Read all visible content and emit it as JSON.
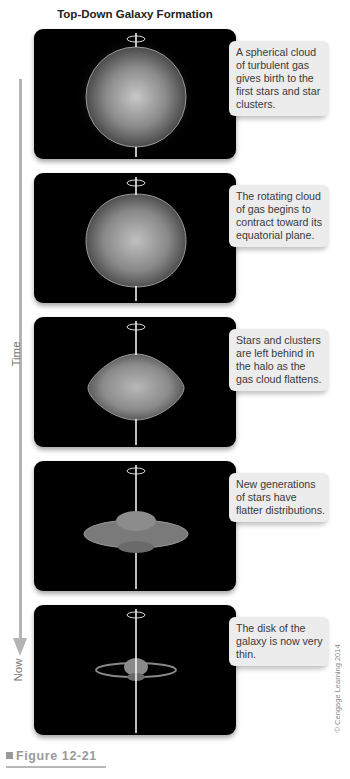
{
  "title": "Top-Down Galaxy Formation",
  "timeline": {
    "start_label": "Time",
    "end_label": "Now",
    "color": "#b4b4b4"
  },
  "panels": [
    {
      "stage": "spherical-cloud",
      "caption": "A spherical cloud of turbulent gas gives birth to the first stars and star clusters."
    },
    {
      "stage": "rotating-contracting",
      "caption": "The rotating cloud of gas begins to contract toward its equatorial plane."
    },
    {
      "stage": "flattening",
      "caption": "Stars and clusters are left behind in the halo as the gas cloud flattens."
    },
    {
      "stage": "new-generations",
      "caption": "New generations of stars have flatter distributions."
    },
    {
      "stage": "thin-disk",
      "caption": "The disk of the galaxy is now very thin."
    }
  ],
  "copyright": "© Cengage Learning 2014",
  "figure_label": "Figure 12-21"
}
